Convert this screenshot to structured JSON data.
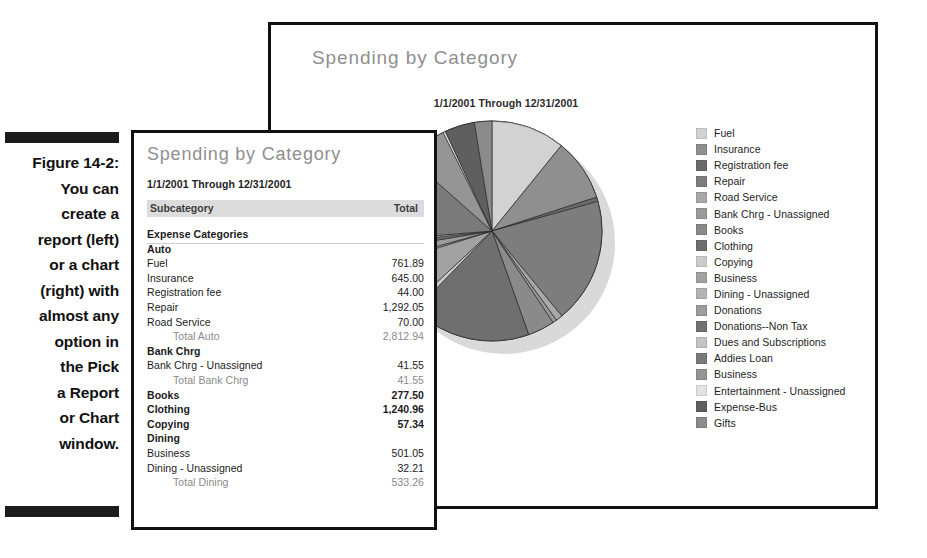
{
  "figure": {
    "caption_lines": [
      "Figure 14-2:",
      "You can",
      "create a",
      "report (left)",
      "or a chart",
      "(right) with",
      "almost any",
      "option in",
      "the Pick",
      "a Report",
      "or Chart",
      "window."
    ]
  },
  "report": {
    "title": "Spending by Category",
    "subtitle": "1/1/2001 Through 12/31/2001",
    "columns": {
      "left": "Subcategory",
      "right": "Total"
    },
    "rows": [
      {
        "label": "Expense Categories",
        "value": "",
        "style": "section"
      },
      {
        "label": "Auto",
        "value": "",
        "style": "group"
      },
      {
        "label": "Fuel",
        "value": "761.89",
        "style": "item"
      },
      {
        "label": "Insurance",
        "value": "645.00",
        "style": "item"
      },
      {
        "label": "Registration fee",
        "value": "44.00",
        "style": "item"
      },
      {
        "label": "Repair",
        "value": "1,292.05",
        "style": "item"
      },
      {
        "label": "Road Service",
        "value": "70.00",
        "style": "item"
      },
      {
        "label": "Total Auto",
        "value": "2,812.94",
        "style": "total"
      },
      {
        "label": "Bank Chrg",
        "value": "",
        "style": "group"
      },
      {
        "label": "Bank Chrg - Unassigned",
        "value": "41.55",
        "style": "item"
      },
      {
        "label": "Total Bank Chrg",
        "value": "41.55",
        "style": "total"
      },
      {
        "label": "Books",
        "value": "277.50",
        "style": "group"
      },
      {
        "label": "Clothing",
        "value": "1,240.96",
        "style": "group"
      },
      {
        "label": "Copying",
        "value": "57.34",
        "style": "group"
      },
      {
        "label": "Dining",
        "value": "",
        "style": "group"
      },
      {
        "label": "Business",
        "value": "501.05",
        "style": "item"
      },
      {
        "label": "Dining - Unassigned",
        "value": "32.21",
        "style": "item"
      },
      {
        "label": "Total Dining",
        "value": "533.26",
        "style": "total"
      }
    ]
  },
  "chart": {
    "title": "Spending by Category",
    "subtitle": "1/1/2001 Through 12/31/2001"
  },
  "chart_data": {
    "type": "pie",
    "title": "Spending by Category",
    "subtitle": "1/1/2001 Through 12/31/2001",
    "legend_position": "right",
    "grid": false,
    "categories": [
      "Fuel",
      "Insurance",
      "Registration fee",
      "Repair",
      "Road Service",
      "Bank Chrg - Unassigned",
      "Books",
      "Clothing",
      "Copying",
      "Business",
      "Dining - Unassigned",
      "Donations",
      "Donations--Non Tax",
      "Dues and Subscriptions",
      "Addies Loan",
      "Business",
      "Entertainment - Unassigned",
      "Expense-Bus",
      "Gifts"
    ],
    "values": [
      761.89,
      645.0,
      44.0,
      1292.05,
      70.0,
      41.55,
      277.5,
      1240.96,
      57.34,
      501.05,
      32.21,
      120.0,
      60.0,
      35.0,
      900.0,
      430.0,
      25.0,
      310.0,
      180.0
    ],
    "colors": [
      "#d2d2d2",
      "#8f8f8f",
      "#6b6b6b",
      "#7d7d7d",
      "#a8a8a8",
      "#9a9a9a",
      "#8a8a8a",
      "#6f6f6f",
      "#cccccc",
      "#a2a2a2",
      "#b4b4b4",
      "#9c9c9c",
      "#717171",
      "#c4c4c4",
      "#7a7a7a",
      "#959595",
      "#e2e2e2",
      "#5f5f5f",
      "#8b8b8b"
    ]
  }
}
